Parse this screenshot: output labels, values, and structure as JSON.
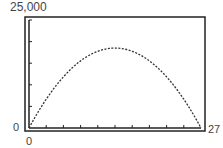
{
  "chart_data": {
    "type": "line",
    "title": "",
    "xlabel": "",
    "ylabel": "",
    "xlim": [
      0,
      27
    ],
    "ylim": [
      0,
      25000
    ],
    "x_tick_step": 2.7,
    "y_tick_step": 5000,
    "grid": false,
    "series": [
      {
        "name": "parabola",
        "style": "dotted",
        "x": [
          0,
          2.7,
          5.4,
          8.1,
          10.8,
          13.5,
          16.2,
          18.9,
          21.6,
          24.3,
          27
        ],
        "values": [
          0,
          6660,
          11840,
          15540,
          17760,
          18500,
          17760,
          15540,
          11840,
          6660,
          0
        ]
      }
    ],
    "labels": {
      "y_max": "25,000",
      "y_min": "0",
      "x_min": "0",
      "x_max": "27"
    }
  }
}
